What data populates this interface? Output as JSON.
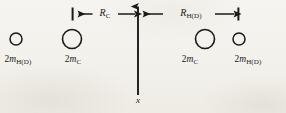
{
  "figure": {
    "type": "physics-diagram",
    "ink_color": "#1a1a1a",
    "background_color": "#f4f2ee",
    "width": 286,
    "height": 113
  },
  "axis": {
    "name": "x",
    "x_position": 138,
    "top_y": 2,
    "bottom_y": 95,
    "arrow_direction": "up"
  },
  "particles": [
    {
      "id": "left-outer",
      "cx": 16,
      "cy": 39,
      "r": 6,
      "label_num": "2",
      "label_sym": "m",
      "label_sub": "H(D)",
      "label_x": 18,
      "label_y": 55
    },
    {
      "id": "left-inner",
      "cx": 72,
      "cy": 39,
      "r": 9.5,
      "label_num": "2",
      "label_sym": "m",
      "label_sub": "C",
      "label_x": 73,
      "label_y": 55
    },
    {
      "id": "right-inner",
      "cx": 205,
      "cy": 39,
      "r": 9.5,
      "label_num": "2",
      "label_sym": "m",
      "label_sub": "C",
      "label_x": 190,
      "label_y": 55
    },
    {
      "id": "right-outer",
      "cx": 239,
      "cy": 39,
      "r": 6,
      "label_num": "2",
      "label_sym": "m",
      "label_sub": "H(D)",
      "label_x": 248,
      "label_y": 55
    }
  ],
  "dimensions": [
    {
      "id": "r-c",
      "sym": "R",
      "sub": "C",
      "from_x": 72,
      "to_x": 138,
      "y": 14,
      "label_x": 105,
      "label_y": 8,
      "tick_side": "left",
      "arrow_style": "double"
    },
    {
      "id": "r-hd",
      "sym": "R",
      "sub": "H(D)",
      "from_x": 138,
      "to_x": 238,
      "y": 14,
      "label_x": 191,
      "label_y": 8,
      "tick_side": "right",
      "arrow_style": "double"
    }
  ]
}
